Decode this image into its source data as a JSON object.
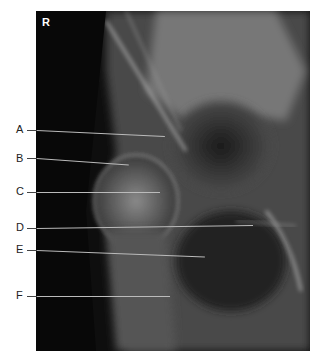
{
  "figure": {
    "side_marker": "R",
    "labels": [
      {
        "letter": "A"
      },
      {
        "letter": "B"
      },
      {
        "letter": "C"
      },
      {
        "letter": "D"
      },
      {
        "letter": "E"
      },
      {
        "letter": "F"
      }
    ]
  }
}
